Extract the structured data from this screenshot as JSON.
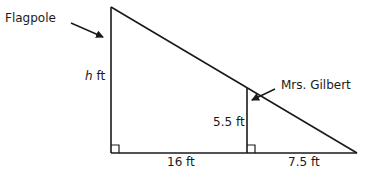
{
  "diagram": {
    "labels": {
      "flagpole": "Flagpole",
      "person": "Mrs. Gilbert",
      "pole_height_var": "h",
      "pole_height_unit": " ft",
      "person_height": "5.5 ft",
      "base_left": "16 ft",
      "base_right": "7.5 ft"
    },
    "measurements": {
      "pole_height": "h ft",
      "person_height_ft": 5.5,
      "distance_pole_to_person_ft": 16,
      "person_shadow_ft": 7.5
    },
    "colors": {
      "line": "#1a1a1a",
      "background": "#ffffff"
    }
  }
}
